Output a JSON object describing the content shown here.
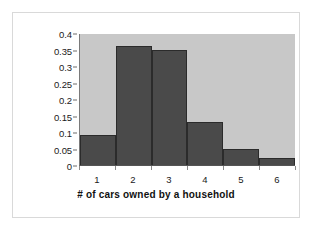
{
  "chart_data": {
    "type": "bar",
    "title": "",
    "subtitle": "",
    "xlabel": "# of cars owned by a household",
    "ylabel": "Probability",
    "categories": [
      "1",
      "2",
      "3",
      "4",
      "5",
      "6"
    ],
    "values": [
      0.09,
      0.36,
      0.35,
      0.13,
      0.05,
      0.02
    ],
    "series": [
      {
        "name": "Probability",
        "values": [
          0.09,
          0.36,
          0.35,
          0.13,
          0.05,
          0.02
        ]
      }
    ],
    "ylim": [
      0,
      0.4
    ],
    "yticks": [
      "0",
      "0.05",
      "0.1",
      "0.15",
      "0.2",
      "0.25",
      "0.3",
      "0.35",
      "0.4"
    ],
    "ytick_values": [
      0,
      0.05,
      0.1,
      0.15,
      0.2,
      0.25,
      0.3,
      0.35,
      0.4
    ],
    "xticks": [
      "1",
      "2",
      "3",
      "4",
      "5",
      "6"
    ],
    "grid": false,
    "legend": false,
    "legend_position": "none",
    "colors": {
      "bar_fill": "#4a4a4a",
      "bar_edge": "#2b2b2b",
      "plot_background": "#c8c8c8",
      "figure_background": "#ffffff",
      "frame_border": "#d9d9d9",
      "axis_line": "#555555",
      "tick_label": "#1a1a1a",
      "axis_title": "#111111"
    },
    "annotations": []
  }
}
